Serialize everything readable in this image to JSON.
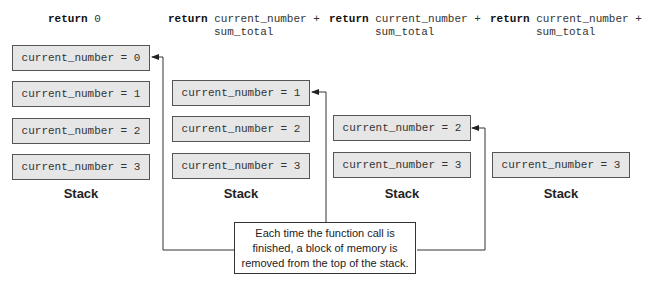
{
  "returns": [
    {
      "keyword": "return",
      "expr_line1": "0",
      "expr_line2": ""
    },
    {
      "keyword": "return",
      "expr_line1": "current_number +",
      "expr_line2": "sum_total"
    },
    {
      "keyword": "return",
      "expr_line1": "current_number +",
      "expr_line2": "sum_total"
    },
    {
      "keyword": "return",
      "expr_line1": "current_number +",
      "expr_line2": "sum_total"
    }
  ],
  "stacks": [
    {
      "label": "Stack",
      "frames": [
        "current_number = 0",
        "current_number = 1",
        "current_number = 2",
        "current_number = 3"
      ]
    },
    {
      "label": "Stack",
      "frames": [
        "current_number = 1",
        "current_number = 2",
        "current_number = 3"
      ]
    },
    {
      "label": "Stack",
      "frames": [
        "current_number = 2",
        "current_number = 3"
      ]
    },
    {
      "label": "Stack",
      "frames": [
        "current_number = 3"
      ]
    }
  ],
  "note": {
    "line1": "Each time the function call is",
    "line2": "finished, a block of memory is",
    "line3": "removed from the top of the stack."
  },
  "colors": {
    "frame_fill": "#e6e6e6",
    "frame_border": "#555555",
    "line": "#333333"
  }
}
